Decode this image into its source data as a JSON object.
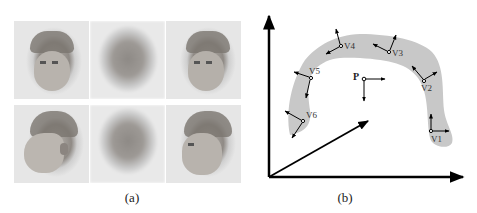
{
  "figure": {
    "panel_a": {
      "caption": "(a)",
      "grid": {
        "rows": 2,
        "cols": 3,
        "cells": [
          {
            "row": 0,
            "col": 0,
            "kind": "face-photo",
            "pose": "three-quarter-left"
          },
          {
            "row": 0,
            "col": 1,
            "kind": "blurred-reconstruction"
          },
          {
            "row": 0,
            "col": 2,
            "kind": "face-photo",
            "pose": "three-quarter-left"
          },
          {
            "row": 1,
            "col": 0,
            "kind": "face-photo",
            "pose": "profile-left"
          },
          {
            "row": 1,
            "col": 1,
            "kind": "blurred-reconstruction"
          },
          {
            "row": 1,
            "col": 2,
            "kind": "face-photo",
            "pose": "three-quarter-left"
          }
        ]
      }
    },
    "panel_b": {
      "caption": "(b)",
      "point_label": "P",
      "vertex_labels": [
        "V1",
        "V2",
        "V3",
        "V4",
        "V5",
        "V6"
      ],
      "colors": {
        "manifold_fill": "#c8c8c8",
        "axis": "#000000"
      }
    }
  }
}
